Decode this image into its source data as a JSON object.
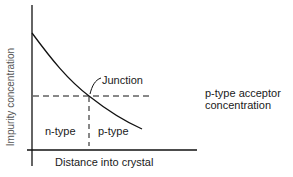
{
  "diagram": {
    "y_axis_label": "Impurity concentration",
    "x_axis_label": "Distance into crystal",
    "junction_label": "Junction",
    "left_region_label": "n-type",
    "right_region_label": "p-type",
    "reference_line_label_line1": "p-type acceptor",
    "reference_line_label_line2": "concentration"
  }
}
